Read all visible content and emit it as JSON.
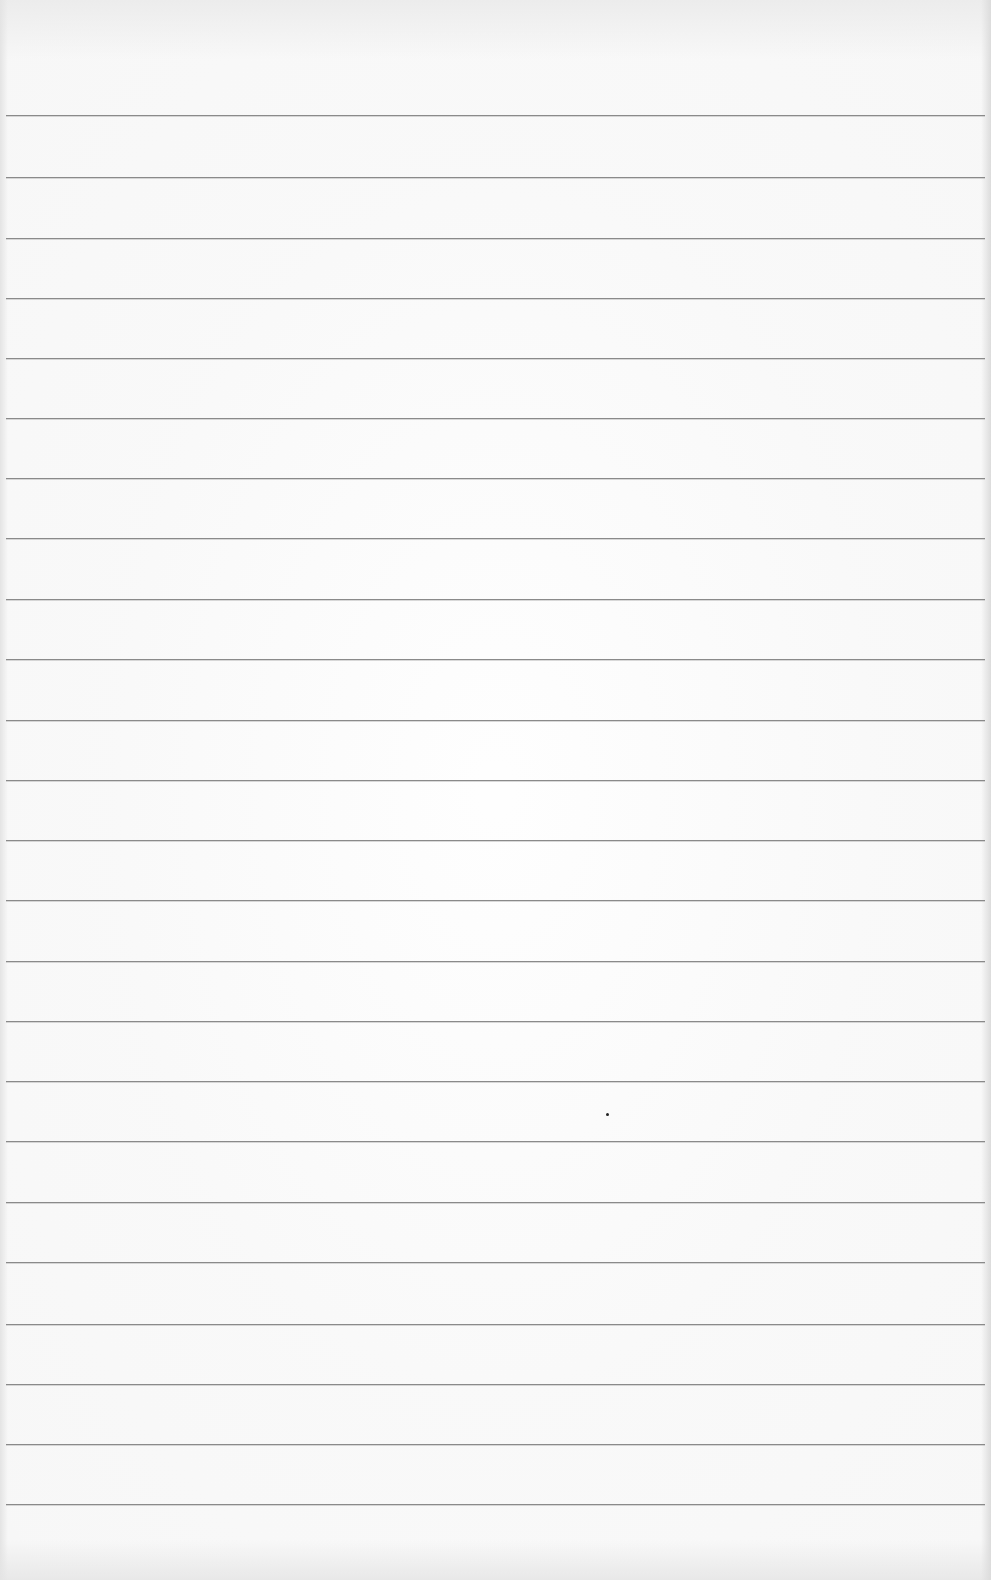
{
  "document": {
    "type": "lined-paper",
    "text": "",
    "paper_color": "#f7f7f7",
    "rule_color": "#8a8a8a",
    "rule_count": 24,
    "rule_positions_y": [
      115,
      177,
      238,
      298,
      358,
      418,
      478,
      538,
      599,
      659,
      720,
      780,
      840,
      900,
      961,
      1021,
      1081,
      1141,
      1202,
      1262,
      1324,
      1384,
      1444,
      1504
    ],
    "marks": [
      {
        "type": "ink-dot",
        "x": 607,
        "y": 1114,
        "color": "#222222"
      }
    ]
  }
}
